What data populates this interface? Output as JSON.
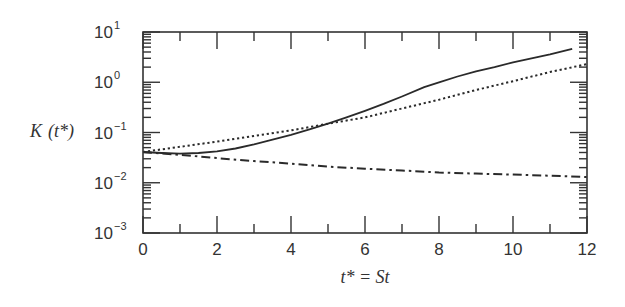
{
  "chart_data": {
    "type": "line",
    "title": "",
    "xlabel": "t* = St",
    "ylabel": "K (t*)",
    "xlim": [
      0,
      12
    ],
    "ylim": [
      0.001,
      10
    ],
    "yscale": "log",
    "grid": false,
    "legend": null,
    "x_ticks": [
      0,
      2,
      4,
      6,
      8,
      10,
      12
    ],
    "x_tick_labels": [
      "0",
      "2",
      "4",
      "6",
      "8",
      "10",
      "12"
    ],
    "y_ticks": [
      10,
      1,
      0.1,
      0.01,
      0.001
    ],
    "y_tick_labels": [
      {
        "base": "10",
        "exp": "1"
      },
      {
        "base": "10",
        "exp": "0"
      },
      {
        "base": "10",
        "exp": "−1"
      },
      {
        "base": "10",
        "exp": "−2"
      },
      {
        "base": "10",
        "exp": "−3"
      }
    ],
    "series": [
      {
        "name": "solid",
        "style": "solid",
        "x": [
          0,
          0.5,
          1,
          1.5,
          2,
          2.5,
          3,
          3.5,
          4,
          4.5,
          5,
          5.5,
          6,
          6.5,
          7,
          7.6,
          8,
          8.5,
          9,
          9.5,
          10,
          10.5,
          11,
          11.6
        ],
        "y": [
          0.041,
          0.039,
          0.038,
          0.039,
          0.042,
          0.048,
          0.058,
          0.072,
          0.09,
          0.115,
          0.15,
          0.2,
          0.27,
          0.37,
          0.52,
          0.8,
          1.0,
          1.3,
          1.65,
          2.0,
          2.5,
          3.0,
          3.6,
          4.6
        ]
      },
      {
        "name": "dotted",
        "style": "dotted",
        "x": [
          0,
          1,
          2,
          3,
          4,
          5,
          6,
          7,
          8,
          9,
          10,
          11,
          12
        ],
        "y": [
          0.041,
          0.052,
          0.066,
          0.085,
          0.11,
          0.15,
          0.2,
          0.3,
          0.45,
          0.7,
          1.05,
          1.6,
          2.3
        ]
      },
      {
        "name": "dash-dot",
        "style": "dashdot",
        "x": [
          0,
          1,
          2,
          3,
          4,
          5,
          6,
          7,
          8,
          9,
          10,
          11,
          12
        ],
        "y": [
          0.041,
          0.036,
          0.031,
          0.027,
          0.024,
          0.021,
          0.019,
          0.0175,
          0.016,
          0.0152,
          0.0145,
          0.0138,
          0.013
        ]
      }
    ]
  },
  "labels": {
    "ylabel_main": "K",
    "ylabel_arg": "(t*)",
    "xlabel": "t* = St"
  }
}
